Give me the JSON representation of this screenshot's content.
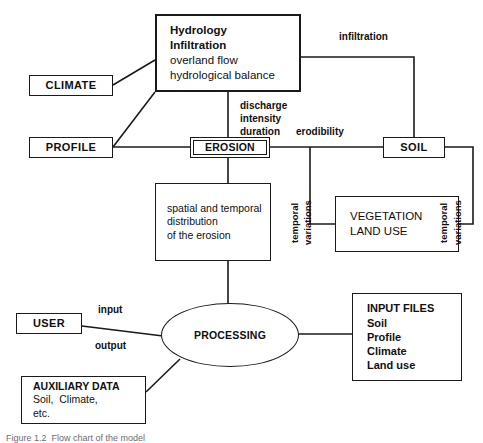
{
  "diagram": {
    "nodes": {
      "hydrology": {
        "lines": [
          "Hydrology",
          "Infiltration",
          "overland flow",
          "hydrological balance"
        ]
      },
      "climate": {
        "label": "CLIMATE"
      },
      "profile": {
        "label": "PROFILE"
      },
      "erosion": {
        "label": "EROSION"
      },
      "soil": {
        "label": "SOIL"
      },
      "vegetation": {
        "lines": [
          "VEGETATION",
          "LAND USE"
        ]
      },
      "spatial": {
        "lines": [
          "spatial and temporal",
          "distribution",
          "of the erosion"
        ]
      },
      "user": {
        "label": "USER"
      },
      "auxiliary": {
        "lines": [
          "AUXILIARY DATA",
          "Soil,  Climate,",
          "etc."
        ]
      },
      "input_files": {
        "lines": [
          "INPUT FILES",
          "Soil",
          "Profile",
          "Climate",
          "Land use"
        ]
      },
      "processing": {
        "label": "PROCESSING"
      }
    },
    "edge_labels": {
      "infiltration": "infiltration",
      "discharge": "discharge\nintensity\nduration",
      "erodibility": "erodibility",
      "input": "input",
      "output": "output",
      "temporal_left": "temporal",
      "variations_left": "variations",
      "temporal_right": "temporal",
      "variations_right": "variations"
    },
    "caption": "Figure 1.2  Flow chart of the model",
    "colors": {
      "stroke": "#1a1a1a",
      "background": "#ffffff",
      "text": "#101010"
    }
  }
}
